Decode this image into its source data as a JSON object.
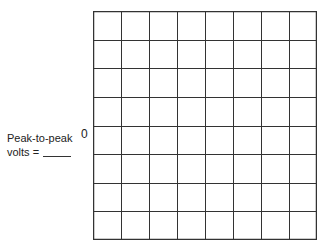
{
  "label": {
    "line1": "Peak-to-peak",
    "line2": "volts ="
  },
  "axis": {
    "zero_label": "0"
  },
  "grid": {
    "columns": 8,
    "rows": 8,
    "line_color": "#333333"
  }
}
